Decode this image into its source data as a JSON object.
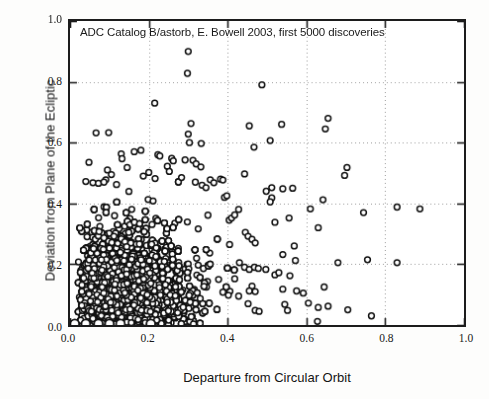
{
  "chart_data": {
    "type": "scatter",
    "title": "ADC Catalog B/astorb, E. Bowell 2003, first 5000 discoveries",
    "xlabel": "Departure from Circular Orbit",
    "ylabel": "Deviation from Plane of the Ecliptic",
    "xlim": [
      0.0,
      1.0
    ],
    "ylim": [
      0.0,
      1.0
    ],
    "xticks": [
      "0.0",
      "0.2",
      "0.4",
      "0.6",
      "0.8",
      "1.0"
    ],
    "yticks": [
      "0.0",
      "0.2",
      "0.4",
      "0.6",
      "0.8",
      "1.0"
    ],
    "xtick_values": [
      0.0,
      0.2,
      0.4,
      0.6,
      0.8,
      1.0
    ],
    "ytick_values": [
      0.0,
      0.2,
      0.4,
      0.6,
      0.8,
      1.0
    ],
    "grid": true,
    "grid_style": "dotted",
    "grid_color": "#9a9a9a",
    "frame_color": "#1c1c1c",
    "marker": "open-circle",
    "marker_color": "#111111",
    "marker_fill": "#ffffff",
    "marker_size": 4.6,
    "point_count": 5000,
    "legend": "none",
    "series": [
      {
        "name": "first 5000 discoveries",
        "description": "Asteroid orbital eccentricity vs inclination proxy; dense cluster at low eccentricity (0.0-0.35) and low inclination (0.0-0.45), thinning toward higher values, with sparse outliers reaching 0.90.",
        "points": [
          [
            0.3,
            0.9
          ],
          [
            0.298,
            0.828
          ],
          [
            0.487,
            0.79
          ],
          [
            0.215,
            0.73
          ],
          [
            0.655,
            0.68
          ],
          [
            0.537,
            0.66
          ],
          [
            0.307,
            0.663
          ],
          [
            0.455,
            0.655
          ],
          [
            0.648,
            0.645
          ],
          [
            0.066,
            0.632
          ],
          [
            0.098,
            0.633
          ],
          [
            0.508,
            0.607
          ],
          [
            0.3,
            0.628
          ],
          [
            0.303,
            0.6
          ],
          [
            0.333,
            0.597
          ],
          [
            0.467,
            0.585
          ],
          [
            0.163,
            0.57
          ],
          [
            0.18,
            0.575
          ],
          [
            0.223,
            0.56
          ],
          [
            0.228,
            0.556
          ],
          [
            0.258,
            0.548
          ],
          [
            0.262,
            0.54
          ],
          [
            0.13,
            0.563
          ],
          [
            0.132,
            0.547
          ],
          [
            0.703,
            0.518
          ],
          [
            0.697,
            0.492
          ],
          [
            0.312,
            0.542
          ],
          [
            0.32,
            0.53
          ],
          [
            0.332,
            0.52
          ],
          [
            0.292,
            0.543
          ],
          [
            0.443,
            0.497
          ],
          [
            0.048,
            0.535
          ],
          [
            0.247,
            0.522
          ],
          [
            0.252,
            0.505
          ],
          [
            0.2,
            0.502
          ],
          [
            0.145,
            0.518
          ],
          [
            0.095,
            0.51
          ],
          [
            0.105,
            0.495
          ],
          [
            0.356,
            0.478
          ],
          [
            0.365,
            0.468
          ],
          [
            0.382,
            0.48
          ],
          [
            0.388,
            0.477
          ],
          [
            0.318,
            0.47
          ],
          [
            0.335,
            0.46
          ],
          [
            0.345,
            0.452
          ],
          [
            0.283,
            0.485
          ],
          [
            0.216,
            0.482
          ],
          [
            0.186,
            0.49
          ],
          [
            0.04,
            0.472
          ],
          [
            0.058,
            0.468
          ],
          [
            0.072,
            0.466
          ],
          [
            0.086,
            0.47
          ],
          [
            0.118,
            0.462
          ],
          [
            0.512,
            0.452
          ],
          [
            0.54,
            0.448
          ],
          [
            0.565,
            0.45
          ],
          [
            0.498,
            0.44
          ],
          [
            0.512,
            0.418
          ],
          [
            0.508,
            0.405
          ],
          [
            0.642,
            0.412
          ],
          [
            0.61,
            0.382
          ],
          [
            0.745,
            0.37
          ],
          [
            0.83,
            0.388
          ],
          [
            0.888,
            0.382
          ],
          [
            0.392,
            0.42
          ],
          [
            0.398,
            0.425
          ],
          [
            0.404,
            0.345
          ],
          [
            0.41,
            0.352
          ],
          [
            0.418,
            0.362
          ],
          [
            0.428,
            0.38
          ],
          [
            0.556,
            0.352
          ],
          [
            0.52,
            0.338
          ],
          [
            0.63,
            0.32
          ],
          [
            0.569,
            0.26
          ],
          [
            0.445,
            0.305
          ],
          [
            0.452,
            0.292
          ],
          [
            0.462,
            0.282
          ],
          [
            0.47,
            0.27
          ],
          [
            0.405,
            0.265
          ],
          [
            0.572,
            0.212
          ],
          [
            0.54,
            0.232
          ],
          [
            0.43,
            0.205
          ],
          [
            0.443,
            0.19
          ],
          [
            0.455,
            0.183
          ],
          [
            0.468,
            0.19
          ],
          [
            0.478,
            0.186
          ],
          [
            0.497,
            0.183
          ],
          [
            0.52,
            0.165
          ],
          [
            0.53,
            0.172
          ],
          [
            0.558,
            0.162
          ],
          [
            0.68,
            0.205
          ],
          [
            0.755,
            0.215
          ],
          [
            0.83,
            0.205
          ],
          [
            0.418,
            0.152
          ],
          [
            0.462,
            0.128
          ],
          [
            0.455,
            0.112
          ],
          [
            0.47,
            0.11
          ],
          [
            0.54,
            0.118
          ],
          [
            0.575,
            0.112
          ],
          [
            0.592,
            0.105
          ],
          [
            0.645,
            0.125
          ],
          [
            0.428,
            0.095
          ],
          [
            0.452,
            0.07
          ],
          [
            0.47,
            0.048
          ],
          [
            0.48,
            0.045
          ],
          [
            0.545,
            0.068
          ],
          [
            0.552,
            0.048
          ],
          [
            0.605,
            0.072
          ],
          [
            0.63,
            0.058
          ],
          [
            0.655,
            0.062
          ],
          [
            0.705,
            0.05
          ],
          [
            0.765,
            0.03
          ],
          [
            0.628,
            0.012
          ],
          [
            0.402,
            0.098
          ],
          [
            0.388,
            0.108
          ]
        ]
      }
    ]
  },
  "axis": {
    "x_ticks": [
      {
        "label": "0.0",
        "value": 0.0
      },
      {
        "label": "0.2",
        "value": 0.2
      },
      {
        "label": "0.4",
        "value": 0.4
      },
      {
        "label": "0.6",
        "value": 0.6
      },
      {
        "label": "0.8",
        "value": 0.8
      },
      {
        "label": "1.0",
        "value": 1.0
      }
    ],
    "y_ticks": [
      {
        "label": "0.0",
        "value": 0.0
      },
      {
        "label": "0.2",
        "value": 0.2
      },
      {
        "label": "0.4",
        "value": 0.4
      },
      {
        "label": "0.6",
        "value": 0.6
      },
      {
        "label": "0.8",
        "value": 0.8
      },
      {
        "label": "1.0",
        "value": 1.0
      }
    ]
  }
}
